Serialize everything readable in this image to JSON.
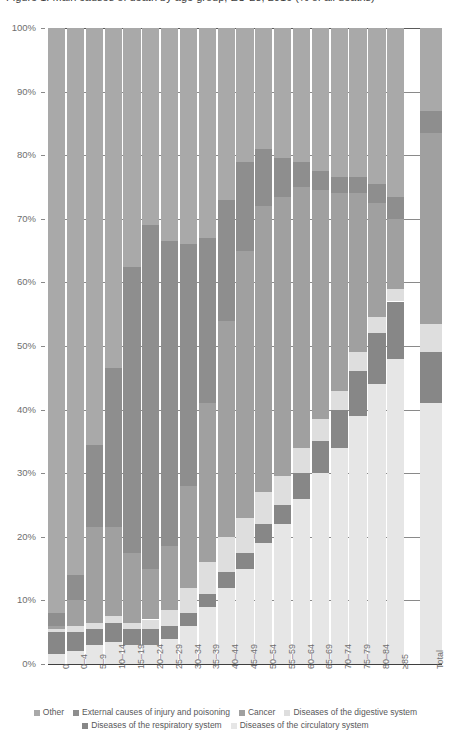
{
  "title": "Figure 1. Main causes of death by age group, EU-28, 2016 (% of all deaths)",
  "axis": {
    "y_ticks": [
      "0%",
      "10%",
      "20%",
      "30%",
      "40%",
      "50%",
      "60%",
      "70%",
      "80%",
      "90%",
      "100%"
    ],
    "y_min": 0,
    "y_max": 100
  },
  "legend": {
    "row1": [
      {
        "label": "Other",
        "color": "#a9a9a9"
      },
      {
        "label": "External causes of injury and poisoning",
        "color": "#8e8e8e"
      },
      {
        "label": "Cancer",
        "color": "#a0a0a0"
      },
      {
        "label": "Diseases of the digestive system",
        "color": "#dedede"
      }
    ],
    "row2": [
      {
        "label": "Diseases of the respiratory system",
        "color": "#878787"
      },
      {
        "label": "Diseases of the circulatory system",
        "color": "#e6e6e6"
      }
    ]
  },
  "chart_data": {
    "type": "bar",
    "subtype": "stacked-percentage",
    "title": "Figure 1. Main causes of death by age group, EU-28, 2016 (% of all deaths)",
    "xlabel": "",
    "ylabel": "",
    "ylim": [
      0,
      100
    ],
    "grid": true,
    "legend_position": "bottom",
    "categories": [
      "0",
      "0–4",
      "5–9",
      "10–14",
      "15–19",
      "20–24",
      "25–29",
      "30–34",
      "35–39",
      "40–44",
      "45–49",
      "50–54",
      "55–59",
      "60–64",
      "65–69",
      "70–74",
      "75–79",
      "80–84",
      "≥85",
      "Total"
    ],
    "series": [
      {
        "name": "Diseases of the circulatory system",
        "color": "#e6e6e6",
        "values": [
          1.5,
          2.0,
          3.0,
          3.5,
          3.0,
          3.0,
          4.0,
          6.0,
          9.0,
          12.0,
          15.0,
          19.0,
          22.0,
          26.0,
          30.0,
          34.0,
          39.0,
          44.0,
          48.0,
          41.0
        ]
      },
      {
        "name": "Diseases of the respiratory system",
        "color": "#878787",
        "values": [
          3.5,
          3.0,
          2.5,
          3.0,
          2.5,
          2.5,
          2.0,
          2.0,
          2.0,
          2.5,
          2.5,
          3.0,
          3.0,
          4.0,
          5.0,
          6.0,
          7.0,
          8.0,
          9.0,
          8.0
        ]
      },
      {
        "name": "Diseases of the digestive system",
        "color": "#dedede",
        "values": [
          0.5,
          1.0,
          1.0,
          1.0,
          1.0,
          1.5,
          2.5,
          4.0,
          5.0,
          5.5,
          5.5,
          5.0,
          4.5,
          4.0,
          3.5,
          3.0,
          3.0,
          2.5,
          2.0,
          4.5
        ]
      },
      {
        "name": "Cancer",
        "color": "#a0a0a0",
        "values": [
          0.5,
          4.0,
          15.0,
          14.0,
          11.0,
          8.0,
          10.0,
          16.0,
          25.0,
          34.0,
          42.0,
          45.0,
          44.0,
          41.0,
          36.0,
          31.0,
          25.0,
          18.0,
          11.0,
          30.0
        ]
      },
      {
        "name": "External causes of injury and poisoning",
        "color": "#8e8e8e",
        "values": [
          2.0,
          4.0,
          13.0,
          25.0,
          45.0,
          54.0,
          48.0,
          38.0,
          26.0,
          19.0,
          14.0,
          9.0,
          6.0,
          4.0,
          3.0,
          2.5,
          2.5,
          3.0,
          3.5,
          3.5
        ]
      },
      {
        "name": "Other",
        "color": "#a9a9a9",
        "values": [
          92.0,
          86.0,
          65.5,
          53.5,
          37.5,
          31.0,
          33.5,
          34.0,
          33.0,
          27.0,
          21.0,
          19.0,
          20.5,
          21.0,
          22.5,
          23.5,
          23.5,
          24.5,
          26.5,
          13.0
        ]
      }
    ]
  }
}
